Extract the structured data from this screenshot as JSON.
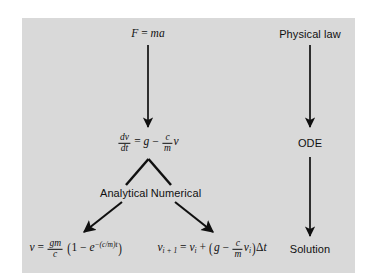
{
  "figure": {
    "background_color": "#d9d9d9",
    "page_color": "#ffffff",
    "ink_color": "#101010"
  },
  "left_column": {
    "physical_law_equation": {
      "label": "F = ma",
      "parts": {
        "lhs": "F",
        "eq": "=",
        "rhs_m": "m",
        "rhs_a": "a"
      }
    },
    "ode_equation": {
      "label": "dv/dt = g - (c/m) v",
      "parts": {
        "num": "dv",
        "den": "dt",
        "eq": "=",
        "g": "g",
        "minus": "−",
        "frac_num": "c",
        "frac_den": "m",
        "v": "v"
      }
    },
    "branch_labels": {
      "analytical": "Analytical",
      "numerical": "Numerical"
    },
    "analytical_solution": {
      "label": "v = (gm/c)(1 − e^(-(c/m)t))",
      "parts": {
        "v": "v",
        "eq": "=",
        "num": "gm",
        "den": "c",
        "lparen": "(",
        "one": "1",
        "minus": "−",
        "e": "e",
        "exponent": "−(c/m)t",
        "rparen": ")"
      }
    },
    "numerical_solution": {
      "label": "v_(i+1) = v_i + (g − (c/m) v_i) Δt",
      "parts": {
        "v1": "v",
        "sub1": "i + 1",
        "eq": "=",
        "v2": "v",
        "sub2": "i",
        "plus": "+",
        "lparen": "(",
        "g": "g",
        "minus": "−",
        "frac_num": "c",
        "frac_den": "m",
        "v3": "v",
        "sub3": "i",
        "rparen": ")",
        "delta": "Δ",
        "t": "t"
      }
    }
  },
  "right_column": {
    "physical_law": "Physical law",
    "ode": "ODE",
    "solution": "Solution"
  },
  "arrows": [
    {
      "name": "law-to-ode-arrow",
      "from": "F = ma",
      "to": "dv/dt = g - (c/m)v"
    },
    {
      "name": "ode-to-analytical-branch",
      "from": "dv/dt",
      "to": "Analytical"
    },
    {
      "name": "ode-to-numerical-branch",
      "from": "dv/dt",
      "to": "Numerical"
    },
    {
      "name": "analytical-to-solution-arrow",
      "from": "Analytical",
      "to": "v = (gm/c)(1 - e^...)"
    },
    {
      "name": "numerical-to-solution-arrow",
      "from": "Numerical",
      "to": "v_(i+1) = ..."
    },
    {
      "name": "physical-law-to-ode-arrow",
      "from": "Physical law",
      "to": "ODE"
    },
    {
      "name": "ode-to-solution-arrow",
      "from": "ODE",
      "to": "Solution"
    }
  ]
}
